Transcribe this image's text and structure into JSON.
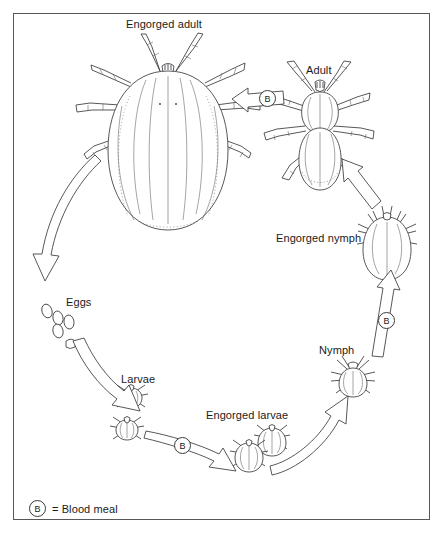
{
  "figure": {
    "background": "#ffffff",
    "border_color": "#58585c",
    "ink_color": "#3a3a3e"
  },
  "labels": {
    "engorged_adult": "Engorged adult",
    "adult": "Adult",
    "engorged_nymph": "Engorged nymph",
    "nymph": "Nymph",
    "engorged_larvae": "Engorged larvae",
    "larvae": "Larvae",
    "eggs": "Eggs"
  },
  "legend": {
    "symbol": "B",
    "equals": "=",
    "text": "Blood meal",
    "full": "= Blood meal"
  },
  "blood_meal_markers": [
    {
      "name": "adult-to-engorged-adult",
      "symbol": "B"
    },
    {
      "name": "nymph-to-engorged-nymph",
      "symbol": "B"
    },
    {
      "name": "larvae-to-engorged-larvae",
      "symbol": "B"
    }
  ],
  "stages": [
    {
      "id": "engorged-adult",
      "label": "Engorged adult"
    },
    {
      "id": "eggs",
      "label": "Eggs"
    },
    {
      "id": "larvae",
      "label": "Larvae"
    },
    {
      "id": "engorged-larvae",
      "label": "Engorged larvae"
    },
    {
      "id": "nymph",
      "label": "Nymph"
    },
    {
      "id": "engorged-nymph",
      "label": "Engorged nymph"
    },
    {
      "id": "adult",
      "label": "Adult"
    }
  ],
  "arrows": [
    {
      "from": "engorged-adult",
      "to": "eggs",
      "blood_meal": false
    },
    {
      "from": "eggs",
      "to": "larvae",
      "blood_meal": false
    },
    {
      "from": "larvae",
      "to": "engorged-larvae",
      "blood_meal": true
    },
    {
      "from": "engorged-larvae",
      "to": "nymph",
      "blood_meal": false
    },
    {
      "from": "nymph",
      "to": "engorged-nymph",
      "blood_meal": true
    },
    {
      "from": "engorged-nymph",
      "to": "adult",
      "blood_meal": false
    },
    {
      "from": "adult",
      "to": "engorged-adult",
      "blood_meal": true
    }
  ]
}
